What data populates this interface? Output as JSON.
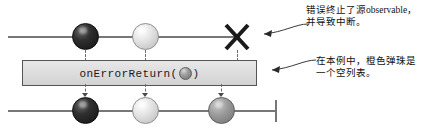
{
  "diagram": {
    "type": "marble-diagram",
    "operator": {
      "name": "onErrorReturn",
      "label_prefix": "onErrorReturn(",
      "label_suffix": ")",
      "inline_marble": "orange-marble"
    },
    "source_timeline": {
      "name": "source-observable",
      "events": [
        {
          "kind": "next",
          "marble": "dark-marble",
          "x": 85
        },
        {
          "kind": "next",
          "marble": "light-marble",
          "x": 145
        },
        {
          "kind": "error",
          "marble": "error-x",
          "x": 237
        }
      ]
    },
    "result_timeline": {
      "name": "result-observable",
      "events": [
        {
          "kind": "next",
          "marble": "dark-marble",
          "x": 85
        },
        {
          "kind": "next",
          "marble": "light-marble",
          "x": 145
        },
        {
          "kind": "next",
          "marble": "orange-marble",
          "x": 221
        },
        {
          "kind": "complete",
          "marble": "completion-bar",
          "x": 276
        }
      ]
    },
    "annotations": [
      {
        "id": "error-note",
        "lines": [
          "错误终止了源observable，",
          "并导致中断。"
        ]
      },
      {
        "id": "orange-marble-note",
        "lines": [
          "在本例中，橙色弹珠是",
          "一个空列表。"
        ]
      }
    ],
    "colors": {
      "timeline": "#777777",
      "dark_marble": "#1f1f1f",
      "light_marble": "#e4e4e4",
      "mid_marble": "#9b9b9b",
      "operator_box_fill": "#dcdcdc",
      "operator_box_border": "#555555",
      "text": "#111111"
    }
  }
}
